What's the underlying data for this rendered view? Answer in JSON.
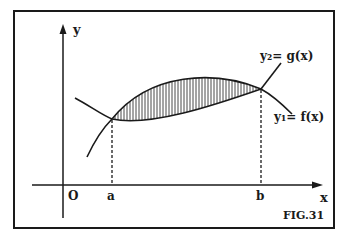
{
  "figure": {
    "caption": "FIG.31",
    "axes": {
      "x_label": "x",
      "y_label": "y",
      "origin_label": "O"
    },
    "points": {
      "a_label": "a",
      "b_label": "b"
    },
    "curves": [
      {
        "name": "g",
        "label": "y₂= g(x)"
      },
      {
        "name": "f",
        "label": "y₁= f(x)"
      }
    ],
    "region": "shaded area between curves from a to b",
    "colors": {
      "ink": "#1a1a1a",
      "background": "#ffffff"
    }
  }
}
